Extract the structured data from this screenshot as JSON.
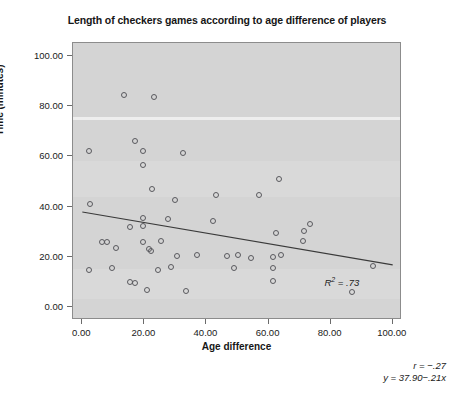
{
  "chart_data": {
    "type": "scatter",
    "title": "Length of checkers games according to age difference of players",
    "xlabel": "Age difference",
    "ylabel": "Time (minutes)",
    "xlim": [
      -3,
      103
    ],
    "ylim": [
      -5,
      105
    ],
    "xticks": [
      "0.00",
      "20.00",
      "40.00",
      "60.00",
      "80.00",
      "100.00"
    ],
    "xtick_values": [
      0,
      20,
      40,
      60,
      80,
      100
    ],
    "yticks": [
      "0.00",
      "20.00",
      "40.00",
      "60.00",
      "80.00",
      "100.00"
    ],
    "ytick_values": [
      0,
      20,
      40,
      60,
      80,
      100
    ],
    "grid": false,
    "legend": "none",
    "series": [
      {
        "name": "games",
        "marker": "open-circle",
        "points": [
          [
            13.5,
            84.5
          ],
          [
            23.0,
            83.5
          ],
          [
            2.0,
            62.0
          ],
          [
            17.0,
            66.0
          ],
          [
            19.5,
            62.0
          ],
          [
            32.5,
            61.5
          ],
          [
            19.5,
            56.5
          ],
          [
            63.5,
            51.0
          ],
          [
            22.5,
            47.0
          ],
          [
            43.0,
            44.5
          ],
          [
            57.0,
            44.5
          ],
          [
            2.5,
            41.0
          ],
          [
            30.0,
            42.5
          ],
          [
            19.5,
            35.5
          ],
          [
            27.5,
            35.0
          ],
          [
            42.0,
            34.5
          ],
          [
            73.5,
            33.0
          ],
          [
            19.5,
            32.5
          ],
          [
            15.5,
            32.0
          ],
          [
            62.5,
            29.5
          ],
          [
            71.5,
            30.5
          ],
          [
            6.5,
            26.0
          ],
          [
            8.0,
            26.0
          ],
          [
            19.5,
            26.0
          ],
          [
            25.5,
            26.5
          ],
          [
            71.0,
            26.5
          ],
          [
            11.0,
            23.5
          ],
          [
            21.5,
            23.0
          ],
          [
            22.0,
            22.5
          ],
          [
            30.5,
            20.5
          ],
          [
            37.0,
            21.0
          ],
          [
            46.5,
            20.5
          ],
          [
            50.0,
            21.0
          ],
          [
            54.5,
            19.5
          ],
          [
            61.5,
            20.0
          ],
          [
            64.0,
            21.0
          ],
          [
            2.0,
            15.0
          ],
          [
            9.5,
            15.5
          ],
          [
            24.5,
            15.0
          ],
          [
            28.5,
            16.0
          ],
          [
            49.0,
            15.5
          ],
          [
            61.5,
            15.5
          ],
          [
            93.5,
            16.5
          ],
          [
            15.5,
            10.0
          ],
          [
            17.0,
            9.5
          ],
          [
            61.5,
            10.5
          ],
          [
            21.0,
            7.0
          ],
          [
            33.5,
            6.5
          ],
          [
            87.0,
            6.0
          ]
        ]
      }
    ],
    "fit_line": {
      "label": "regression-line",
      "x_start": 0,
      "y_start": 37.9,
      "x_end": 100,
      "y_end": 16.9
    },
    "annotations": {
      "r_squared": "R",
      "r_squared_sup": "2",
      "r_squared_value": " = .73",
      "r_text": "r = −.27",
      "equation_text": "y = 37.90−.21x"
    }
  }
}
